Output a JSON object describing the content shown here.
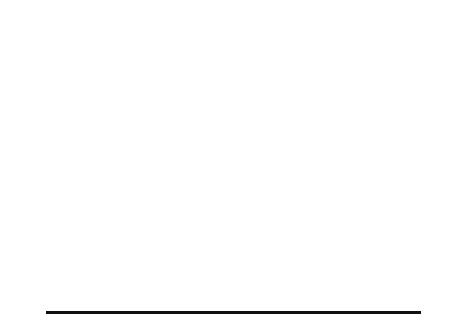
{
  "figure": {
    "axis": {
      "ylabel": "Expression ratio",
      "ytick_label": "0",
      "xticks": [
        "0",
        "50",
        "100",
        "150"
      ],
      "xlim": [
        0,
        160
      ],
      "xtick_values": [
        0,
        50,
        100,
        150
      ]
    },
    "panels": [
      {
        "id": "a",
        "xlabel": "(a) Time (h)",
        "subplots": [
          {
            "label": "C5"
          },
          {
            "label": "C4"
          },
          {
            "label": "C3"
          },
          {
            "label": "C2"
          },
          {
            "label": "C1"
          }
        ]
      },
      {
        "id": "b",
        "xlabel": "(b) Time (h)",
        "subplots": [
          {
            "label": "S phase"
          },
          {
            "label": "M phase"
          },
          {
            "label": "Late G1"
          },
          {
            "label": "G2 phase"
          },
          {
            "label": "Early G1"
          }
        ]
      },
      {
        "id": "c",
        "xlabel": "(c) Time (h)",
        "subplots": [
          {
            "label": "C5"
          },
          {
            "label": "C4"
          },
          {
            "label": "C3"
          },
          {
            "label": "C2"
          },
          {
            "label": "C1"
          }
        ]
      },
      {
        "id": "d",
        "xlabel": "(d) Time (h)",
        "subplots": [
          {
            "label": "C5"
          },
          {
            "label": "C4"
          },
          {
            "label": "C3"
          },
          {
            "label": "C2"
          },
          {
            "label": "C1"
          }
        ]
      }
    ]
  },
  "chart_data": {
    "type": "line",
    "title": "",
    "xlabel": "Time (h)",
    "ylabel": "Expression ratio",
    "xlim": [
      0,
      160
    ],
    "ylim": [
      0,
      1
    ],
    "grid": false,
    "legend": "none",
    "x": [
      0,
      10,
      20,
      30,
      40,
      50,
      60,
      70,
      80,
      90,
      100,
      110,
      120,
      130,
      140,
      150,
      160
    ],
    "panels": [
      {
        "id": "a",
        "xlabel": "(a) Time (h)",
        "series": [
          {
            "name": "C5",
            "values": [
              0.3,
              0.44,
              0.6,
              0.68,
              0.64,
              0.54,
              0.46,
              0.44,
              0.47,
              0.48,
              0.5,
              0.56,
              0.62,
              0.64,
              0.62,
              0.58,
              0.56
            ]
          },
          {
            "name": "C4",
            "values": [
              0.26,
              0.28,
              0.33,
              0.44,
              0.58,
              0.7,
              0.76,
              0.74,
              0.64,
              0.5,
              0.38,
              0.32,
              0.32,
              0.38,
              0.46,
              0.52,
              0.55
            ]
          },
          {
            "name": "C3",
            "values": [
              0.3,
              0.58,
              0.76,
              0.68,
              0.46,
              0.28,
              0.2,
              0.18,
              0.22,
              0.36,
              0.58,
              0.7,
              0.62,
              0.44,
              0.3,
              0.24,
              0.22
            ]
          },
          {
            "name": "C2",
            "values": [
              0.36,
              0.42,
              0.54,
              0.64,
              0.7,
              0.72,
              0.68,
              0.62,
              0.56,
              0.52,
              0.5,
              0.51,
              0.52,
              0.52,
              0.51,
              0.5,
              0.5
            ]
          },
          {
            "name": "C1",
            "values": [
              0.22,
              0.18,
              0.16,
              0.16,
              0.18,
              0.22,
              0.3,
              0.42,
              0.56,
              0.64,
              0.6,
              0.46,
              0.34,
              0.28,
              0.26,
              0.26,
              0.27
            ]
          }
        ]
      },
      {
        "id": "b",
        "xlabel": "(b) Time (h)",
        "series": [
          {
            "name": "S phase",
            "values": [
              0.3,
              0.46,
              0.62,
              0.7,
              0.64,
              0.54,
              0.47,
              0.45,
              0.48,
              0.5,
              0.52,
              0.58,
              0.64,
              0.66,
              0.62,
              0.58,
              0.56
            ]
          },
          {
            "name": "M phase",
            "values": [
              0.26,
              0.28,
              0.34,
              0.46,
              0.6,
              0.72,
              0.77,
              0.74,
              0.63,
              0.48,
              0.36,
              0.31,
              0.32,
              0.4,
              0.48,
              0.54,
              0.57
            ]
          },
          {
            "name": "Late G1",
            "values": [
              0.4,
              0.56,
              0.62,
              0.56,
              0.42,
              0.32,
              0.28,
              0.3,
              0.4,
              0.56,
              0.7,
              0.72,
              0.62,
              0.48,
              0.38,
              0.34,
              0.33
            ]
          },
          {
            "name": "G2 phase",
            "values": [
              0.38,
              0.44,
              0.56,
              0.66,
              0.72,
              0.73,
              0.68,
              0.61,
              0.55,
              0.51,
              0.49,
              0.5,
              0.52,
              0.53,
              0.52,
              0.51,
              0.5
            ]
          },
          {
            "name": "Early G1",
            "values": [
              0.22,
              0.18,
              0.16,
              0.16,
              0.19,
              0.23,
              0.31,
              0.44,
              0.58,
              0.66,
              0.6,
              0.46,
              0.34,
              0.28,
              0.26,
              0.26,
              0.28
            ]
          }
        ]
      },
      {
        "id": "c",
        "xlabel": "(c) Time (h)",
        "series": [
          {
            "name": "C5",
            "values": [
              0.32,
              0.46,
              0.62,
              0.68,
              0.62,
              0.52,
              0.46,
              0.45,
              0.48,
              0.5,
              0.52,
              0.58,
              0.63,
              0.65,
              0.62,
              0.58,
              0.56
            ]
          },
          {
            "name": "C4",
            "values": [
              0.28,
              0.3,
              0.36,
              0.48,
              0.62,
              0.72,
              0.76,
              0.72,
              0.6,
              0.46,
              0.35,
              0.31,
              0.33,
              0.41,
              0.49,
              0.55,
              0.58
            ]
          },
          {
            "name": "C3",
            "values": [
              0.32,
              0.6,
              0.78,
              0.7,
              0.48,
              0.3,
              0.22,
              0.2,
              0.24,
              0.38,
              0.6,
              0.72,
              0.62,
              0.44,
              0.3,
              0.24,
              0.23
            ]
          },
          {
            "name": "C2",
            "values": [
              0.36,
              0.44,
              0.56,
              0.66,
              0.72,
              0.72,
              0.67,
              0.6,
              0.55,
              0.51,
              0.49,
              0.5,
              0.52,
              0.53,
              0.52,
              0.51,
              0.5
            ]
          },
          {
            "name": "C1",
            "values": [
              0.22,
              0.18,
              0.16,
              0.16,
              0.18,
              0.23,
              0.31,
              0.44,
              0.58,
              0.66,
              0.6,
              0.45,
              0.33,
              0.27,
              0.26,
              0.26,
              0.27
            ]
          }
        ]
      },
      {
        "id": "d",
        "xlabel": "(d) Time (h)",
        "series": [
          {
            "name": "C5",
            "values": [
              0.34,
              0.48,
              0.62,
              0.66,
              0.6,
              0.52,
              0.47,
              0.46,
              0.49,
              0.51,
              0.53,
              0.58,
              0.62,
              0.64,
              0.61,
              0.58,
              0.56
            ]
          },
          {
            "name": "C4",
            "values": [
              0.28,
              0.3,
              0.36,
              0.48,
              0.62,
              0.73,
              0.77,
              0.73,
              0.61,
              0.46,
              0.35,
              0.31,
              0.34,
              0.42,
              0.5,
              0.56,
              0.58
            ]
          },
          {
            "name": "C3",
            "values": [
              0.34,
              0.62,
              0.78,
              0.68,
              0.46,
              0.3,
              0.22,
              0.2,
              0.24,
              0.4,
              0.62,
              0.7,
              0.58,
              0.4,
              0.28,
              0.23,
              0.22
            ]
          },
          {
            "name": "C2",
            "values": [
              0.36,
              0.46,
              0.58,
              0.68,
              0.73,
              0.72,
              0.66,
              0.59,
              0.54,
              0.5,
              0.49,
              0.51,
              0.53,
              0.54,
              0.53,
              0.51,
              0.5
            ]
          },
          {
            "name": "C1",
            "values": [
              0.24,
              0.19,
              0.16,
              0.16,
              0.18,
              0.23,
              0.32,
              0.46,
              0.6,
              0.66,
              0.59,
              0.44,
              0.32,
              0.27,
              0.26,
              0.26,
              0.28
            ]
          }
        ]
      }
    ]
  }
}
